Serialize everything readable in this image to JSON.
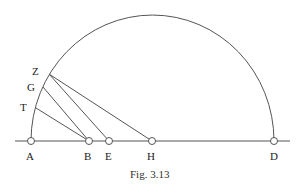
{
  "figure": {
    "caption": "Fig. 3.13",
    "stroke_color": "#555555",
    "points": [
      {
        "label": "A",
        "x": 31,
        "y": 141,
        "lx": 26,
        "ly": 151
      },
      {
        "label": "B",
        "x": 89,
        "y": 141,
        "lx": 84,
        "ly": 151
      },
      {
        "label": "E",
        "x": 109,
        "y": 141,
        "lx": 105,
        "ly": 151
      },
      {
        "label": "H",
        "x": 152,
        "y": 141,
        "lx": 147,
        "ly": 151
      },
      {
        "label": "D",
        "x": 274,
        "y": 141,
        "lx": 270,
        "ly": 151
      }
    ],
    "arc_points": [
      {
        "label": "Z",
        "x": 49,
        "y": 74,
        "lx": 32,
        "ly": 66
      },
      {
        "label": "G",
        "x": 43,
        "y": 87,
        "lx": 27,
        "ly": 82
      },
      {
        "label": "T",
        "x": 36,
        "y": 108,
        "lx": 20,
        "ly": 102
      }
    ],
    "segments": [
      {
        "from": "Z",
        "to": "H"
      },
      {
        "from": "Z",
        "to": "E"
      },
      {
        "from": "G",
        "to": "B"
      },
      {
        "from": "T",
        "to": "B"
      }
    ],
    "baseline": {
      "x1": 15,
      "x2": 290,
      "y": 141
    },
    "semicircle": {
      "cx": 152.5,
      "cy": 141,
      "rx": 121.5,
      "ry": 126
    }
  }
}
